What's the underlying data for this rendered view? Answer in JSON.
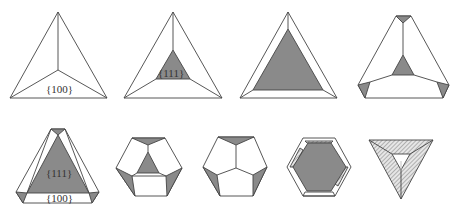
{
  "colors": {
    "background": "#ffffff",
    "line": "#444444",
    "face_111": "#8a8a8a",
    "face_100": "#ffffff",
    "hatch": "#9a9a9a"
  },
  "shapes": [
    {
      "id": 1,
      "row": 1,
      "description": "Tetrahedron-like projection with {100} faces",
      "labels": [
        "{100}"
      ]
    },
    {
      "id": 2,
      "row": 1,
      "description": "Small {111} truncation at center",
      "labels": [
        "{111}"
      ]
    },
    {
      "id": 3,
      "row": 1,
      "description": "Large {111} triangle face",
      "labels": []
    },
    {
      "id": 4,
      "row": 1,
      "description": "Truncated corners with small {111} center",
      "labels": []
    },
    {
      "id": 5,
      "row": 2,
      "description": "Large {111} face with {100} bands and truncated corners",
      "labels": [
        "{111}",
        "{100}"
      ]
    },
    {
      "id": 6,
      "row": 2,
      "description": "Hexagonal outline with central {111} triangle",
      "labels": []
    },
    {
      "id": 7,
      "row": 2,
      "description": "Pentagonal-like faces, no center triangle",
      "labels": []
    },
    {
      "id": 8,
      "row": 2,
      "description": "Hexagon with large {111} face and hatched edges",
      "labels": []
    },
    {
      "id": 9,
      "row": 2,
      "description": "Inverted hatched triangle with small open center",
      "labels": []
    }
  ],
  "labels": {
    "shape1_face": "{100}",
    "shape2_face": "{111}",
    "shape5_face111": "{111}",
    "shape5_face100": "{100}"
  }
}
